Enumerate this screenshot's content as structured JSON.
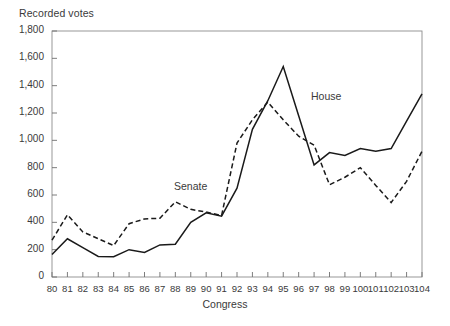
{
  "chart_data": {
    "type": "line",
    "title": "",
    "ylabel": "Recorded votes",
    "xlabel": "Congress",
    "ylim": [
      0,
      1800
    ],
    "ytick_labels": [
      "0",
      "200",
      "400",
      "600",
      "800",
      "1,000",
      "1,200",
      "1,400",
      "1,600",
      "1,800"
    ],
    "ytick_values": [
      0,
      200,
      400,
      600,
      800,
      1000,
      1200,
      1400,
      1600,
      1800
    ],
    "grid": false,
    "legend_position": "inline-annotations",
    "categories": [
      "80",
      "81",
      "82",
      "83",
      "84",
      "85",
      "86",
      "87",
      "88",
      "89",
      "90",
      "91",
      "92",
      "93",
      "94",
      "95",
      "96",
      "97",
      "98",
      "99",
      "100",
      "101",
      "102",
      "103",
      "104"
    ],
    "x": [
      80,
      81,
      82,
      83,
      84,
      85,
      86,
      87,
      88,
      89,
      90,
      91,
      92,
      93,
      94,
      95,
      96,
      97,
      98,
      99,
      100,
      101,
      102,
      103,
      104
    ],
    "series": [
      {
        "name": "House",
        "style": "solid",
        "color": "#1a1a1a",
        "values": [
          165,
          280,
          215,
          150,
          148,
          200,
          180,
          235,
          240,
          400,
          470,
          445,
          650,
          1080,
          1290,
          1540,
          1180,
          820,
          910,
          890,
          940,
          920,
          940,
          1140,
          1340
        ]
      },
      {
        "name": "Senate",
        "style": "dashed",
        "color": "#1a1a1a",
        "values": [
          270,
          455,
          330,
          280,
          230,
          390,
          425,
          430,
          550,
          495,
          475,
          450,
          980,
          1150,
          1280,
          1150,
          1030,
          965,
          675,
          730,
          800,
          670,
          545,
          700,
          920
        ]
      }
    ],
    "annotations": [
      {
        "text": "Senate",
        "series": "Senate"
      },
      {
        "text": "House",
        "series": "House"
      }
    ]
  }
}
